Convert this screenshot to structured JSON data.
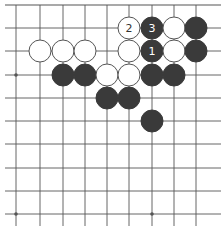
{
  "board": {
    "line_color": "#555555",
    "black_color": "#3a3a3a",
    "white_fill": "#ffffff",
    "white_stroke": "#555555",
    "columns_x": [
      16,
      40,
      63,
      85,
      107,
      129,
      152,
      174,
      196
    ],
    "rows_y": [
      5,
      28,
      51,
      75,
      98,
      121,
      144,
      168,
      191,
      214
    ],
    "h_line_extent": [
      5,
      221
    ],
    "v_line_extent": [
      5,
      226
    ],
    "stone_radius": 11,
    "star_points": [
      {
        "col": 0,
        "row": 3
      },
      {
        "col": 6,
        "row": 3
      },
      {
        "col": 0,
        "row": 9
      },
      {
        "col": 6,
        "row": 9
      }
    ],
    "stones": [
      {
        "color": "white",
        "col": 5,
        "row": 1,
        "label": "2"
      },
      {
        "color": "black",
        "col": 6,
        "row": 1,
        "label": "3"
      },
      {
        "color": "white",
        "col": 7,
        "row": 1,
        "label": ""
      },
      {
        "color": "black",
        "col": 8,
        "row": 1,
        "label": ""
      },
      {
        "color": "white",
        "col": 1,
        "row": 2,
        "label": ""
      },
      {
        "color": "white",
        "col": 2,
        "row": 2,
        "label": ""
      },
      {
        "color": "white",
        "col": 3,
        "row": 2,
        "label": ""
      },
      {
        "color": "white",
        "col": 5,
        "row": 2,
        "label": ""
      },
      {
        "color": "black",
        "col": 6,
        "row": 2,
        "label": "1"
      },
      {
        "color": "white",
        "col": 7,
        "row": 2,
        "label": ""
      },
      {
        "color": "black",
        "col": 8,
        "row": 2,
        "label": ""
      },
      {
        "color": "black",
        "col": 2,
        "row": 3,
        "label": ""
      },
      {
        "color": "black",
        "col": 3,
        "row": 3,
        "label": ""
      },
      {
        "color": "white",
        "col": 4,
        "row": 3,
        "label": ""
      },
      {
        "color": "white",
        "col": 5,
        "row": 3,
        "label": ""
      },
      {
        "color": "black",
        "col": 6,
        "row": 3,
        "label": ""
      },
      {
        "color": "black",
        "col": 7,
        "row": 3,
        "label": ""
      },
      {
        "color": "black",
        "col": 4,
        "row": 4,
        "label": ""
      },
      {
        "color": "black",
        "col": 5,
        "row": 4,
        "label": ""
      },
      {
        "color": "black",
        "col": 6,
        "row": 5,
        "label": ""
      }
    ]
  }
}
